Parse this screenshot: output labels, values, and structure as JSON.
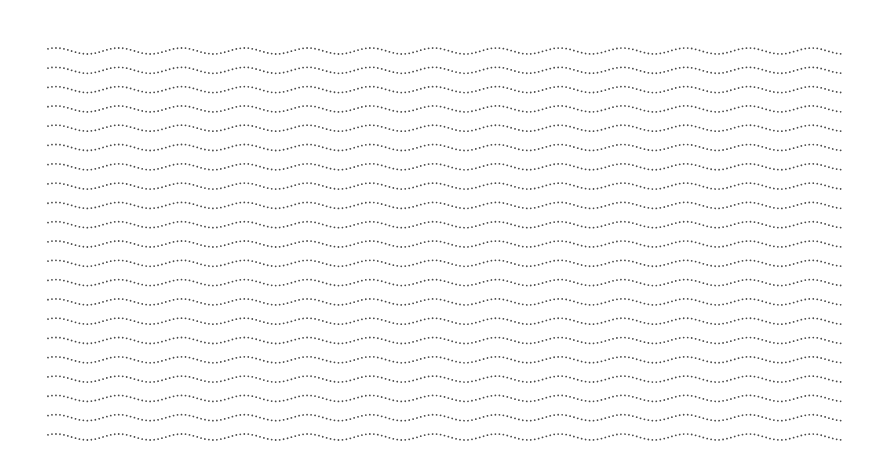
{
  "pattern": {
    "type": "dotted-wavy-lines",
    "rows": 21,
    "first_row_y": 51,
    "row_spacing": 19.3,
    "x_start": 48,
    "x_end": 843,
    "wavelength": 63,
    "amplitude": 3,
    "dot_spacing": 4,
    "dot_color": "#4a4a4a",
    "background": "#ffffff"
  }
}
